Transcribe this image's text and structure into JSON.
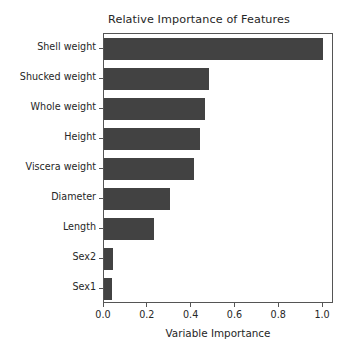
{
  "chart_data": {
    "type": "bar",
    "orientation": "horizontal",
    "title": "Relative Importance of Features",
    "xlabel": "Variable Importance",
    "ylabel": "",
    "categories": [
      "Shell weight",
      "Shucked weight",
      "Whole weight",
      "Height",
      "Viscera weight",
      "Diameter",
      "Length",
      "Sex2",
      "Sex1"
    ],
    "values": [
      1.0,
      0.48,
      0.46,
      0.44,
      0.41,
      0.3,
      0.23,
      0.04,
      0.035
    ],
    "xlim": [
      0.0,
      1.05
    ],
    "xticks": [
      0.0,
      0.2,
      0.4,
      0.6,
      0.8,
      1.0
    ],
    "xtick_labels": [
      "0.0",
      "0.2",
      "0.4",
      "0.6",
      "0.8",
      "1.0"
    ],
    "grid": false,
    "legend": null,
    "bar_color": "#424242",
    "axes_color": "#555555",
    "text_color": "#262626",
    "background": "#ffffff"
  }
}
